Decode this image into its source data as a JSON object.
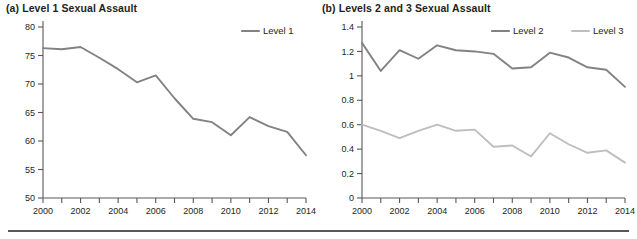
{
  "figure": {
    "panel_a_title": "(a) Level 1 Sexual Assault",
    "panel_b_title": "(b) Levels 2 and 3 Sexual Assault"
  },
  "colors": {
    "level1": "#808285",
    "level2": "#808285",
    "level3": "#bcbec0",
    "axis": "#58585a",
    "text": "#231f20",
    "rule": "#58585a",
    "background": "#ffffff"
  },
  "chart_data": [
    {
      "type": "line",
      "title": "(a) Level 1 Sexual Assault",
      "xlabel": "",
      "ylabel": "",
      "xlim": [
        2000,
        2014
      ],
      "ylim": [
        50,
        80
      ],
      "grid": false,
      "legend_position": "top-right",
      "x": [
        2000,
        2001,
        2002,
        2003,
        2004,
        2005,
        2006,
        2007,
        2008,
        2009,
        2010,
        2011,
        2012,
        2013,
        2014
      ],
      "xtick_labels": [
        "2000",
        "2002",
        "2004",
        "2006",
        "2008",
        "2010",
        "2012",
        "2014"
      ],
      "xtick_values": [
        2000,
        2002,
        2004,
        2006,
        2008,
        2010,
        2012,
        2014
      ],
      "ytick_labels": [
        "50",
        "55",
        "60",
        "65",
        "70",
        "75",
        "80"
      ],
      "ytick_values": [
        50,
        55,
        60,
        65,
        70,
        75,
        80
      ],
      "series": [
        {
          "name": "Level 1",
          "color": "#808285",
          "values": [
            76.3,
            76.1,
            76.5,
            74.6,
            72.6,
            70.3,
            71.5,
            67.5,
            63.9,
            63.3,
            61.0,
            64.2,
            62.6,
            61.6,
            57.5
          ]
        }
      ]
    },
    {
      "type": "line",
      "title": "(b) Levels 2 and 3 Sexual Assault",
      "xlabel": "",
      "ylabel": "",
      "xlim": [
        2000,
        2014
      ],
      "ylim": [
        0,
        1.4
      ],
      "grid": false,
      "legend_position": "top-right",
      "x": [
        2000,
        2001,
        2002,
        2003,
        2004,
        2005,
        2006,
        2007,
        2008,
        2009,
        2010,
        2011,
        2012,
        2013,
        2014
      ],
      "xtick_labels": [
        "2000",
        "2002",
        "2004",
        "2006",
        "2008",
        "2010",
        "2012",
        "2014"
      ],
      "xtick_values": [
        2000,
        2002,
        2004,
        2006,
        2008,
        2010,
        2012,
        2014
      ],
      "ytick_labels": [
        "0",
        "0.2",
        "0.4",
        "0.6",
        "0.8",
        "1",
        "1.2",
        "1.4"
      ],
      "ytick_values": [
        0,
        0.2,
        0.4,
        0.6,
        0.8,
        1.0,
        1.2,
        1.4
      ],
      "series": [
        {
          "name": "Level 2",
          "color": "#808285",
          "values": [
            1.27,
            1.04,
            1.21,
            1.14,
            1.25,
            1.21,
            1.2,
            1.18,
            1.06,
            1.07,
            1.19,
            1.15,
            1.07,
            1.05,
            0.91
          ]
        },
        {
          "name": "Level 3",
          "color": "#bcbec0",
          "values": [
            0.6,
            0.55,
            0.49,
            0.55,
            0.6,
            0.55,
            0.56,
            0.42,
            0.43,
            0.34,
            0.53,
            0.44,
            0.37,
            0.39,
            0.29
          ]
        }
      ]
    }
  ]
}
